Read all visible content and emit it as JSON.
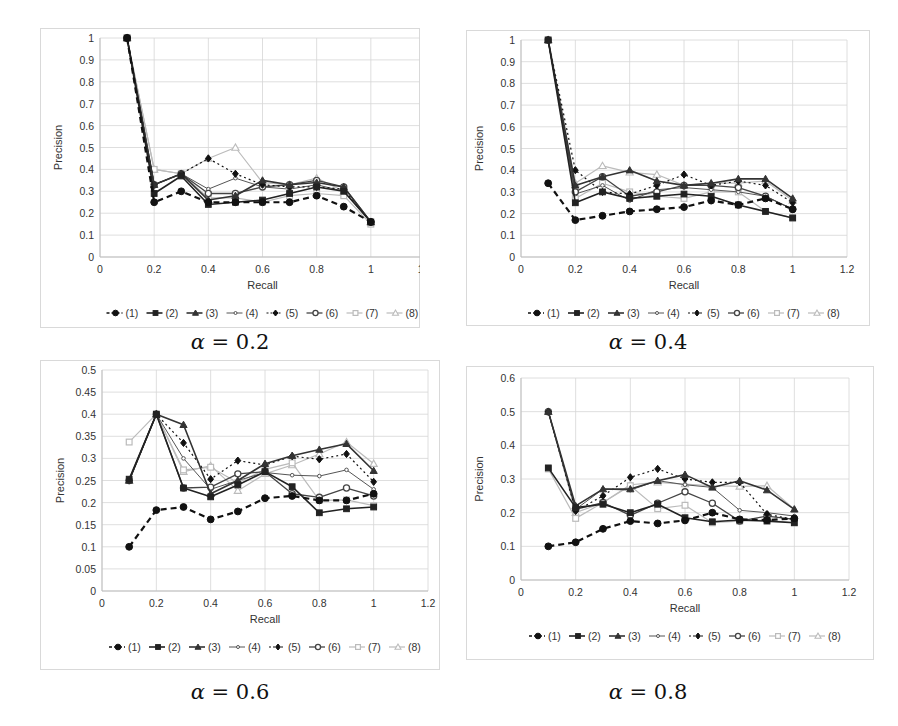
{
  "figure": {
    "legend_labels": [
      "(1)",
      "(2)",
      "(3)",
      "(4)",
      "(5)",
      "(6)",
      "(7)",
      "(8)"
    ]
  },
  "chart_data": [
    {
      "type": "line",
      "caption": "α = 0.2",
      "caption_symbol": "α",
      "caption_value": "= 0.2",
      "xlabel": "Recall",
      "ylabel": "Precision",
      "xlim": [
        0,
        1.2
      ],
      "ylim": [
        0,
        1
      ],
      "xticks": [
        0,
        0.2,
        0.4,
        0.6,
        0.8,
        1,
        1.2
      ],
      "xtick_labels": [
        "0",
        "0.2",
        "0.4",
        "0.6",
        "0.8",
        "1",
        "1.2"
      ],
      "yticks": [
        0,
        0.1,
        0.2,
        0.3,
        0.4,
        0.5,
        0.6,
        0.7,
        0.8,
        0.9,
        1
      ],
      "ytick_labels": [
        "0",
        "0.1",
        "0.2",
        "0.3",
        "0.4",
        "0.5",
        "0.6",
        "0.7",
        "0.8",
        "0.9",
        "1"
      ],
      "grid": true,
      "legend_position": "bottom",
      "x": [
        0.1,
        0.2,
        0.3,
        0.4,
        0.5,
        0.6,
        0.7,
        0.8,
        0.9,
        1.0
      ],
      "series": [
        {
          "name": "(1)",
          "values": [
            1.0,
            0.25,
            0.3,
            0.25,
            0.25,
            0.25,
            0.25,
            0.28,
            0.23,
            0.16
          ]
        },
        {
          "name": "(2)",
          "values": [
            1.0,
            0.29,
            0.37,
            0.24,
            0.25,
            0.26,
            0.29,
            0.32,
            0.3,
            0.16
          ]
        },
        {
          "name": "(3)",
          "values": [
            1.0,
            0.33,
            0.38,
            0.26,
            0.28,
            0.35,
            0.33,
            0.34,
            0.32,
            0.16
          ]
        },
        {
          "name": "(4)",
          "values": [
            1.0,
            0.33,
            0.38,
            0.31,
            0.36,
            0.32,
            0.31,
            0.33,
            0.3,
            0.16
          ]
        },
        {
          "name": "(5)",
          "values": [
            1.0,
            0.33,
            0.38,
            0.45,
            0.38,
            0.33,
            0.32,
            0.32,
            0.31,
            0.16
          ]
        },
        {
          "name": "(6)",
          "values": [
            1.0,
            0.33,
            0.38,
            0.29,
            0.29,
            0.32,
            0.33,
            0.35,
            0.32,
            0.16
          ]
        },
        {
          "name": "(7)",
          "values": [
            1.0,
            0.4,
            0.38,
            0.27,
            0.27,
            0.25,
            0.28,
            0.29,
            0.28,
            0.15
          ]
        },
        {
          "name": "(8)",
          "values": [
            1.0,
            0.4,
            0.38,
            0.45,
            0.5,
            0.34,
            0.33,
            0.36,
            0.3,
            0.16
          ]
        }
      ]
    },
    {
      "type": "line",
      "caption": "α = 0.4",
      "caption_symbol": "α",
      "caption_value": "= 0.4",
      "xlabel": "Recall",
      "ylabel": "Precision",
      "xlim": [
        0,
        1.2
      ],
      "ylim": [
        0,
        1
      ],
      "xticks": [
        0,
        0.2,
        0.4,
        0.6,
        0.8,
        1,
        1.2
      ],
      "xtick_labels": [
        "0",
        "0.2",
        "0.4",
        "0.6",
        "0.8",
        "1",
        "1.2"
      ],
      "yticks": [
        0,
        0.1,
        0.2,
        0.3,
        0.4,
        0.5,
        0.6,
        0.7,
        0.8,
        0.9,
        1
      ],
      "ytick_labels": [
        "0",
        "0.1",
        "0.2",
        "0.3",
        "0.4",
        "0.5",
        "0.6",
        "0.7",
        "0.8",
        "0.9",
        "1"
      ],
      "grid": true,
      "legend_position": "bottom",
      "x": [
        0.1,
        0.2,
        0.3,
        0.4,
        0.5,
        0.6,
        0.7,
        0.8,
        0.9,
        1.0
      ],
      "series": [
        {
          "name": "(1)",
          "values": [
            0.34,
            0.17,
            0.19,
            0.21,
            0.22,
            0.23,
            0.26,
            0.24,
            0.27,
            0.22
          ]
        },
        {
          "name": "(2)",
          "values": [
            1.0,
            0.25,
            0.3,
            0.27,
            0.28,
            0.29,
            0.28,
            0.24,
            0.21,
            0.18
          ]
        },
        {
          "name": "(3)",
          "values": [
            1.0,
            0.33,
            0.37,
            0.4,
            0.35,
            0.33,
            0.34,
            0.36,
            0.36,
            0.27
          ]
        },
        {
          "name": "(4)",
          "values": [
            1.0,
            0.29,
            0.33,
            0.26,
            0.31,
            0.32,
            0.31,
            0.3,
            0.28,
            0.22
          ]
        },
        {
          "name": "(5)",
          "values": [
            1.0,
            0.4,
            0.3,
            0.29,
            0.33,
            0.38,
            0.33,
            0.35,
            0.33,
            0.25
          ]
        },
        {
          "name": "(6)",
          "values": [
            1.0,
            0.3,
            0.37,
            0.28,
            0.3,
            0.33,
            0.33,
            0.32,
            0.28,
            0.22
          ]
        },
        {
          "name": "(7)",
          "values": [
            1.0,
            0.27,
            0.34,
            0.3,
            0.28,
            0.27,
            0.3,
            0.3,
            0.21,
            0.18
          ]
        },
        {
          "name": "(8)",
          "values": [
            1.0,
            0.34,
            0.42,
            0.39,
            0.38,
            0.33,
            0.34,
            0.34,
            0.35,
            0.26
          ]
        }
      ]
    },
    {
      "type": "line",
      "caption": "α = 0.6",
      "caption_symbol": "α",
      "caption_value": "= 0.6",
      "xlabel": "Recall",
      "ylabel": "Precision",
      "xlim": [
        0,
        1.2
      ],
      "ylim": [
        0,
        0.5
      ],
      "xticks": [
        0,
        0.2,
        0.4,
        0.6,
        0.8,
        1,
        1.2
      ],
      "xtick_labels": [
        "0",
        "0.2",
        "0.4",
        "0.6",
        "0.8",
        "1",
        "1.2"
      ],
      "yticks": [
        0,
        0.05,
        0.1,
        0.15,
        0.2,
        0.25,
        0.3,
        0.35,
        0.4,
        0.45,
        0.5
      ],
      "ytick_labels": [
        "0",
        "0.05",
        "0.1",
        "0.15",
        "0.2",
        "0.25",
        "0.3",
        "0.35",
        "0.4",
        "0.45",
        "0.5"
      ],
      "grid": true,
      "legend_position": "bottom",
      "x": [
        0.1,
        0.2,
        0.3,
        0.4,
        0.5,
        0.6,
        0.7,
        0.8,
        0.9,
        1.0
      ],
      "series": [
        {
          "name": "(1)",
          "values": [
            0.1,
            0.183,
            0.19,
            0.162,
            0.18,
            0.21,
            0.215,
            0.205,
            0.205,
            0.22
          ]
        },
        {
          "name": "(2)",
          "values": [
            0.253,
            0.4,
            0.233,
            0.213,
            0.24,
            0.27,
            0.236,
            0.177,
            0.186,
            0.19
          ]
        },
        {
          "name": "(3)",
          "values": [
            0.25,
            0.4,
            0.376,
            0.22,
            0.25,
            0.288,
            0.306,
            0.32,
            0.333,
            0.272
          ]
        },
        {
          "name": "(4)",
          "values": [
            0.25,
            0.4,
            0.3,
            0.23,
            0.25,
            0.268,
            0.262,
            0.26,
            0.274,
            0.23
          ]
        },
        {
          "name": "(5)",
          "values": [
            0.25,
            0.4,
            0.335,
            0.253,
            0.295,
            0.285,
            0.305,
            0.298,
            0.31,
            0.247
          ]
        },
        {
          "name": "(6)",
          "values": [
            0.25,
            0.4,
            0.233,
            0.235,
            0.265,
            0.27,
            0.22,
            0.212,
            0.233,
            0.215
          ]
        },
        {
          "name": "(7)",
          "values": [
            0.337,
            0.4,
            0.274,
            0.28,
            0.245,
            0.275,
            0.29,
            0.205,
            0.206,
            0.193
          ]
        },
        {
          "name": "(8)",
          "values": [
            0.25,
            0.4,
            0.27,
            0.283,
            0.227,
            0.265,
            0.285,
            0.31,
            0.337,
            0.288
          ]
        }
      ]
    },
    {
      "type": "line",
      "caption": "α = 0.8",
      "caption_symbol": "α",
      "caption_value": "= 0.8",
      "xlabel": "Recall",
      "ylabel": "Precision",
      "xlim": [
        0,
        1.2
      ],
      "ylim": [
        0,
        0.6
      ],
      "xticks": [
        0,
        0.2,
        0.4,
        0.6,
        0.8,
        1,
        1.2
      ],
      "xtick_labels": [
        "0",
        "0.2",
        "0.4",
        "0.6",
        "0.8",
        "1",
        "1.2"
      ],
      "yticks": [
        0,
        0.1,
        0.2,
        0.3,
        0.4,
        0.5,
        0.6
      ],
      "ytick_labels": [
        "0",
        "0.1",
        "0.2",
        "0.3",
        "0.4",
        "0.5",
        "0.6"
      ],
      "grid": true,
      "legend_position": "bottom",
      "x": [
        0.1,
        0.2,
        0.3,
        0.4,
        0.5,
        0.6,
        0.7,
        0.8,
        0.9,
        1.0
      ],
      "series": [
        {
          "name": "(1)",
          "values": [
            0.1,
            0.112,
            0.152,
            0.175,
            0.168,
            0.177,
            0.2,
            0.18,
            0.178,
            0.183
          ]
        },
        {
          "name": "(2)",
          "values": [
            0.333,
            0.215,
            0.225,
            0.2,
            0.225,
            0.185,
            0.173,
            0.178,
            0.175,
            0.17
          ]
        },
        {
          "name": "(3)",
          "values": [
            0.5,
            0.22,
            0.27,
            0.27,
            0.295,
            0.313,
            0.275,
            0.295,
            0.267,
            0.21
          ]
        },
        {
          "name": "(4)",
          "values": [
            0.5,
            0.21,
            0.27,
            0.267,
            0.295,
            0.283,
            0.275,
            0.207,
            0.2,
            0.19
          ]
        },
        {
          "name": "(5)",
          "values": [
            0.5,
            0.205,
            0.25,
            0.305,
            0.33,
            0.3,
            0.29,
            0.29,
            0.195,
            0.18
          ]
        },
        {
          "name": "(6)",
          "values": [
            0.5,
            0.21,
            0.23,
            0.192,
            0.228,
            0.262,
            0.228,
            0.175,
            0.19,
            0.18
          ]
        },
        {
          "name": "(7)",
          "values": [
            0.33,
            0.183,
            0.23,
            0.28,
            0.212,
            0.222,
            0.17,
            0.175,
            0.178,
            0.17
          ]
        },
        {
          "name": "(8)",
          "values": [
            0.5,
            0.2,
            0.23,
            0.283,
            0.29,
            0.285,
            0.28,
            0.278,
            0.28,
            0.21
          ]
        }
      ]
    }
  ],
  "series_styles": [
    {
      "name": "(1)",
      "color": "#111111",
      "marker": "circle-filled",
      "dash": "6,4",
      "width": 2.2
    },
    {
      "name": "(2)",
      "color": "#222222",
      "marker": "square-filled",
      "dash": "",
      "width": 1.6
    },
    {
      "name": "(3)",
      "color": "#333333",
      "marker": "triangle-filled",
      "dash": "",
      "width": 1.6
    },
    {
      "name": "(4)",
      "color": "#555555",
      "marker": "diamond-open-small",
      "dash": "",
      "width": 1.0
    },
    {
      "name": "(5)",
      "color": "#111111",
      "marker": "diamond-filled",
      "dash": "2,3",
      "width": 1.2
    },
    {
      "name": "(6)",
      "color": "#444444",
      "marker": "circle-open",
      "dash": "",
      "width": 1.3
    },
    {
      "name": "(7)",
      "color": "#bbbbbb",
      "marker": "square-open",
      "dash": "",
      "width": 1.2
    },
    {
      "name": "(8)",
      "color": "#bbbbbb",
      "marker": "triangle-open",
      "dash": "",
      "width": 1.2
    }
  ],
  "colors": {
    "grid": "#d6d6d6",
    "axis": "#bfbfbf",
    "frame": "#d9d9d9",
    "text": "#333333"
  }
}
